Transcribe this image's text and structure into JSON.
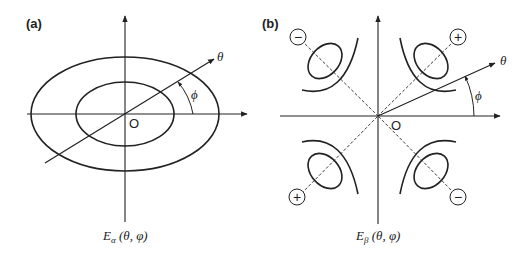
{
  "figure": {
    "panels": [
      {
        "id": "a",
        "label": "(a)",
        "origin_label": "O",
        "theta_label": "θ",
        "phi_label": "ϕ",
        "caption": {
          "symbol": "E",
          "subscript": "α",
          "args": " (θ, φ)"
        }
      },
      {
        "id": "b",
        "label": "(b)",
        "origin_label": "O",
        "theta_label": "θ",
        "phi_label": "ϕ",
        "caption": {
          "symbol": "E",
          "subscript": "β",
          "args": " (θ, φ)"
        },
        "lobes": [
          {
            "quadrant": "upper-left",
            "sign": "−"
          },
          {
            "quadrant": "upper-right",
            "sign": "+"
          },
          {
            "quadrant": "lower-left",
            "sign": "+"
          },
          {
            "quadrant": "lower-right",
            "sign": "−"
          }
        ]
      }
    ],
    "colors": {
      "stroke": "#222222",
      "background": "#ffffff"
    }
  }
}
